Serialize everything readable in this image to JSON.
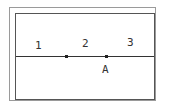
{
  "diagram": {
    "type": "line-regions",
    "frame": {
      "outer_color": "#9a9a9a",
      "inner_color": "#555555"
    },
    "line": {
      "color": "#333333"
    },
    "region_labels": [
      {
        "text": "1"
      },
      {
        "text": "2"
      },
      {
        "text": "3"
      }
    ],
    "points": [
      {
        "label": ""
      },
      {
        "label": "A"
      }
    ]
  }
}
